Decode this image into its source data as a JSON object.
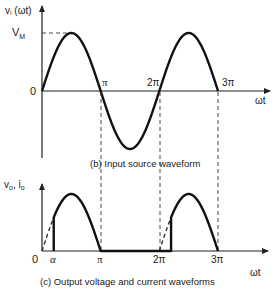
{
  "top_plot": {
    "ylabel": "vᵢ (ωt)",
    "peak_label": "V",
    "peak_sub": "M",
    "origin_label": "0",
    "xlabel": "ωt",
    "ticks": [
      "π",
      "2π",
      "3π"
    ],
    "caption": "(b)  Input source waveform"
  },
  "bottom_plot": {
    "ylabel": "v",
    "ylabel_sub1": "o",
    "ylabel_mid": ", i",
    "ylabel_sub2": "o",
    "origin_label": "0",
    "alpha_label": "α",
    "xlabel": "ωt",
    "ticks": [
      "π",
      "2π",
      "3π"
    ],
    "caption": "(c)  Output voltage and current waveforms"
  },
  "colors": {
    "ink": "#111111",
    "background": "#ffffff"
  }
}
